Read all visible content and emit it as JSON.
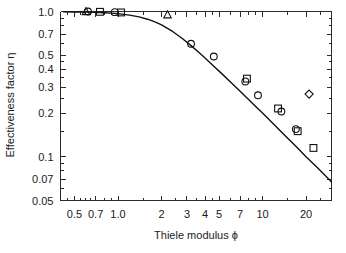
{
  "chart_data": {
    "type": "line",
    "title": "",
    "xlabel": "Thiele modulus ϕ",
    "ylabel": "Effectiveness factor η",
    "xscale": "log",
    "yscale": "log",
    "xlim": [
      0.4,
      30
    ],
    "ylim": [
      0.05,
      1.0
    ],
    "grid": false,
    "legend": "none",
    "xticks": [
      0.5,
      0.7,
      1.0,
      2,
      3,
      4,
      5,
      7,
      10,
      20
    ],
    "xticklabels": [
      "0.5",
      "0.7",
      "1.0",
      "2",
      "3",
      "4",
      "5",
      "7",
      "10",
      "20"
    ],
    "yticks": [
      1.0,
      0.7,
      0.5,
      0.4,
      0.3,
      0.2,
      0.1,
      0.07,
      0.05
    ],
    "yticklabels": [
      "1.0",
      "0.7",
      "0.5",
      "0.4",
      "0.3",
      "0.2",
      "0.1",
      "0.07",
      "0.05"
    ],
    "series": [
      {
        "name": "theoretical curve",
        "type": "line",
        "marker": "none",
        "x": [
          0.42,
          0.5,
          0.6,
          0.7,
          0.8,
          0.9,
          1.0,
          1.2,
          1.4,
          1.6,
          1.8,
          2.0,
          2.4,
          2.8,
          3.2,
          3.6,
          4.0,
          4.6,
          5.2,
          6.0,
          7.0,
          8.0,
          9.0,
          10.0,
          12.0,
          14.0,
          17.0,
          20.0,
          24.0,
          28.0,
          30.0
        ],
        "y": [
          0.995,
          0.993,
          0.99,
          0.986,
          0.981,
          0.974,
          0.966,
          0.945,
          0.918,
          0.885,
          0.848,
          0.808,
          0.726,
          0.649,
          0.582,
          0.526,
          0.478,
          0.42,
          0.375,
          0.327,
          0.282,
          0.248,
          0.221,
          0.2,
          0.167,
          0.143,
          0.118,
          0.1,
          0.084,
          0.072,
          0.067
        ]
      },
      {
        "name": "data circles",
        "type": "scatter",
        "marker": "circle",
        "x": [
          0.62,
          0.95,
          3.2,
          4.6,
          7.6,
          9.3,
          13.5,
          17.0
        ],
        "y": [
          1.0,
          0.99,
          0.6,
          0.49,
          0.33,
          0.265,
          0.205,
          0.155
        ]
      },
      {
        "name": "data squares",
        "type": "scatter",
        "marker": "square",
        "x": [
          0.75,
          1.05,
          7.8,
          12.8,
          17.5,
          22.5
        ],
        "y": [
          0.995,
          0.985,
          0.345,
          0.215,
          0.15,
          0.115
        ]
      },
      {
        "name": "data triangles",
        "type": "scatter",
        "marker": "triangle",
        "x": [
          0.6,
          2.2
        ],
        "y": [
          1.0,
          0.95
        ]
      },
      {
        "name": "outlier diamond",
        "type": "scatter",
        "marker": "diamond",
        "x": [
          21.0
        ],
        "y": [
          0.27
        ]
      }
    ]
  },
  "axes": {
    "x_title": "Thiele modulus ϕ",
    "y_title": "Effectiveness factor η"
  }
}
